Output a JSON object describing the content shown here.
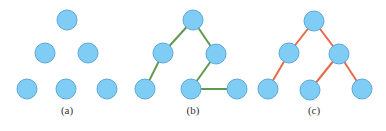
{
  "colors": {
    "node_fill": "#7fcdf5",
    "node_stroke": "#5aa9da",
    "edge_b": "#5f9a4f",
    "edge_c": "#e8694a"
  },
  "node_radius": 10,
  "panels": [
    {
      "caption": "(a)",
      "caption_pos": [
        67,
        114
      ],
      "nodes": [
        [
          67,
          20
        ],
        [
          45,
          53
        ],
        [
          88,
          53
        ],
        [
          27,
          89
        ],
        [
          66,
          89
        ],
        [
          107,
          89
        ]
      ],
      "edges": []
    },
    {
      "caption": "(b)",
      "caption_pos": [
        193,
        114
      ],
      "edge_color": "edge_b",
      "nodes": [
        [
          193,
          20
        ],
        [
          163,
          53
        ],
        [
          216,
          54
        ],
        [
          145,
          89
        ],
        [
          191,
          89
        ],
        [
          237,
          89
        ]
      ],
      "edges": [
        [
          0,
          1
        ],
        [
          0,
          2
        ],
        [
          1,
          3
        ],
        [
          2,
          4
        ],
        [
          4,
          5
        ]
      ]
    },
    {
      "caption": "(c)",
      "caption_pos": [
        314,
        114
      ],
      "edge_color": "edge_c",
      "nodes": [
        [
          314,
          21
        ],
        [
          289,
          53
        ],
        [
          339,
          54
        ],
        [
          268,
          89
        ],
        [
          310,
          90
        ],
        [
          362,
          89
        ]
      ],
      "edges": [
        [
          0,
          1
        ],
        [
          0,
          2
        ],
        [
          1,
          3
        ],
        [
          2,
          4
        ],
        [
          2,
          5
        ]
      ]
    }
  ]
}
